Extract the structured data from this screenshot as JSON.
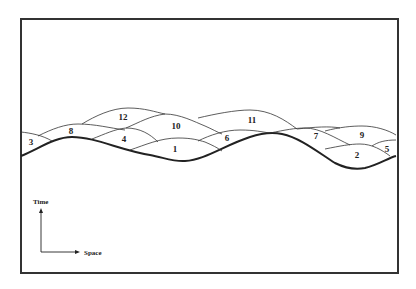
{
  "diagram": {
    "type": "space-time layered regions",
    "regions": [
      {
        "id": "1",
        "label": "1",
        "x": 175,
        "y": 152
      },
      {
        "id": "2",
        "label": "2",
        "x": 357,
        "y": 158
      },
      {
        "id": "3",
        "label": "3",
        "x": 31,
        "y": 145
      },
      {
        "id": "4",
        "label": "4",
        "x": 124,
        "y": 142
      },
      {
        "id": "5",
        "label": "5",
        "x": 387,
        "y": 152
      },
      {
        "id": "6",
        "label": "6",
        "x": 227,
        "y": 141
      },
      {
        "id": "7",
        "label": "7",
        "x": 316,
        "y": 139
      },
      {
        "id": "8",
        "label": "8",
        "x": 71,
        "y": 134
      },
      {
        "id": "9",
        "label": "9",
        "x": 362,
        "y": 138
      },
      {
        "id": "10",
        "label": "10",
        "x": 176,
        "y": 129
      },
      {
        "id": "11",
        "label": "11",
        "x": 252,
        "y": 123
      },
      {
        "id": "12",
        "label": "12",
        "x": 123,
        "y": 120
      }
    ],
    "axes": {
      "vertical_label": "Time",
      "horizontal_label": "Space"
    },
    "colors": {
      "line": "#222222",
      "frame": "#333333",
      "background": "#ffffff"
    }
  }
}
